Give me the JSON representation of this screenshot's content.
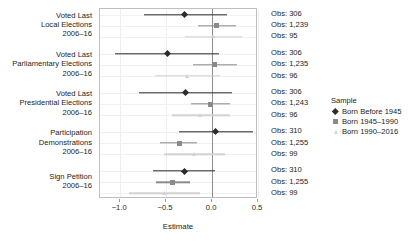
{
  "chart_data": {
    "type": "scatter",
    "title": "",
    "xlabel": "Estimate",
    "ylabel": "",
    "xlim": [
      -1.22,
      0.5
    ],
    "xticks": [
      -1.0,
      -0.5,
      0.0,
      0.5
    ],
    "xticklabels": [
      "−1.0",
      "−0.5",
      "0.0",
      "0.5"
    ],
    "grid": true,
    "zero_reference_line": 0.0,
    "legend": {
      "title": "Sample",
      "position": "right",
      "entries": [
        {
          "label": "Born Before 1945",
          "marker": "diamond",
          "color": "#2b2b2b"
        },
        {
          "label": "Born 1945–1990",
          "marker": "square",
          "color": "#8a8a8a"
        },
        {
          "label": "Born 1990–2016",
          "marker": "triangle",
          "color": "#d2d2d2"
        }
      ]
    },
    "groups": [
      {
        "label": "Voted Last\nLocal Elections\n2006–16",
        "rows": [
          {
            "sample": "Born Before 1945",
            "estimate": -0.3,
            "ci_low": -0.74,
            "ci_high": 0.16,
            "obs": "Obs: 306"
          },
          {
            "sample": "Born 1945–1990",
            "estimate": 0.05,
            "ci_low": -0.15,
            "ci_high": 0.26,
            "obs": "Obs: 1,239"
          },
          {
            "sample": "Born 1990–2016",
            "estimate": 0.02,
            "ci_low": -0.3,
            "ci_high": 0.33,
            "obs": "Obs: 95"
          }
        ]
      },
      {
        "label": "Voted Last\nParliamentary Elections\n2006–16",
        "rows": [
          {
            "sample": "Born Before 1945",
            "estimate": -0.49,
            "ci_low": -1.06,
            "ci_high": 0.08,
            "obs": "Obs: 306"
          },
          {
            "sample": "Born 1945–1990",
            "estimate": 0.03,
            "ci_low": -0.21,
            "ci_high": 0.27,
            "obs": "Obs: 1,235"
          },
          {
            "sample": "Born 1990–2016",
            "estimate": -0.27,
            "ci_low": -0.62,
            "ci_high": 0.09,
            "obs": "Obs: 96"
          }
        ]
      },
      {
        "label": "Voted Last\nPresidential Elections\n2006–16",
        "rows": [
          {
            "sample": "Born Before 1945",
            "estimate": -0.29,
            "ci_low": -0.8,
            "ci_high": 0.22,
            "obs": "Obs: 306"
          },
          {
            "sample": "Born 1945–1990",
            "estimate": -0.02,
            "ci_low": -0.23,
            "ci_high": 0.2,
            "obs": "Obs: 1,243"
          },
          {
            "sample": "Born 1990–2016",
            "estimate": -0.12,
            "ci_low": -0.44,
            "ci_high": 0.2,
            "obs": "Obs: 96"
          }
        ]
      },
      {
        "label": "Participation\nDemonstrations\n2006–16",
        "rows": [
          {
            "sample": "Born Before 1945",
            "estimate": 0.04,
            "ci_low": -0.36,
            "ci_high": 0.45,
            "obs": "Obs: 310"
          },
          {
            "sample": "Born 1945–1990",
            "estimate": -0.36,
            "ci_low": -0.57,
            "ci_high": -0.16,
            "obs": "Obs: 1,255"
          },
          {
            "sample": "Born 1990–2016",
            "estimate": -0.19,
            "ci_low": -0.52,
            "ci_high": 0.14,
            "obs": "Obs: 99"
          }
        ]
      },
      {
        "label": "Sign Petition\n2006–16",
        "rows": [
          {
            "sample": "Born Before 1945",
            "estimate": -0.3,
            "ci_low": -0.64,
            "ci_high": 0.03,
            "obs": "Obs: 310"
          },
          {
            "sample": "Born 1945–1990",
            "estimate": -0.43,
            "ci_low": -0.61,
            "ci_high": -0.24,
            "obs": "Obs: 1,255"
          },
          {
            "sample": "Born 1990–2016",
            "estimate": -0.52,
            "ci_low": -0.9,
            "ci_high": -0.13,
            "obs": "Obs: 99"
          }
        ]
      }
    ]
  }
}
